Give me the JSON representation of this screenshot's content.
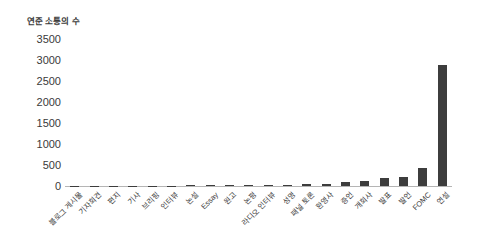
{
  "page": {
    "background": "#ffffff"
  },
  "chart_data": {
    "type": "bar",
    "title": "연준 소통의 수",
    "categories": [
      "블로그 게시물",
      "기자회견",
      "편지",
      "기사",
      "브리핑",
      "인터뷰",
      "논설",
      "Essay",
      "원고",
      "논평",
      "라디오 인터뷰",
      "성명",
      "패널 토론",
      "환영사",
      "증언",
      "개회사",
      "발표",
      "발언",
      "FOMC",
      "연설"
    ],
    "values": [
      2,
      4,
      5,
      6,
      8,
      10,
      12,
      14,
      17,
      20,
      25,
      35,
      50,
      55,
      95,
      120,
      185,
      210,
      420,
      2890
    ],
    "xlabel": "",
    "ylabel": "",
    "ylim": [
      0,
      3500
    ],
    "yticks": [
      0,
      500,
      1000,
      1500,
      2000,
      2500,
      3000,
      3500
    ],
    "grid": false,
    "legend": "none",
    "x_tick_rotation": 45,
    "bar_color": "#3d3d3d",
    "axis_color": "#b5b5b5",
    "text_color": "#3a3a3a"
  }
}
